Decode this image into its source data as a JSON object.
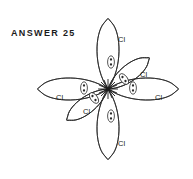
{
  "figure": {
    "caption": "ANSWER 25",
    "title": "ANSWER 25",
    "stroke_color": "#2a2a2a",
    "text_color": "#1b1b1b",
    "background_color": "#ffffff",
    "center_atom": {
      "label": "",
      "x": 108,
      "y": 89
    },
    "ligand_labels": [
      {
        "name": "cl-top",
        "text": "Cl",
        "x": 118,
        "y": 36
      },
      {
        "name": "cl-bottom",
        "text": "Cl",
        "x": 118,
        "y": 140
      },
      {
        "name": "cl-left",
        "text": "Cl",
        "x": 56,
        "y": 94
      },
      {
        "name": "cl-right",
        "text": "Cl",
        "x": 155,
        "y": 94
      },
      {
        "name": "cl-upper-right",
        "text": "Cl",
        "x": 140,
        "y": 71
      },
      {
        "name": "cl-lower-left",
        "text": "Cl",
        "x": 83,
        "y": 108
      }
    ],
    "orbital_lobes": [
      {
        "name": "p-orbital-vertical-top",
        "orientation": "vertical",
        "angle": 90
      },
      {
        "name": "p-orbital-vertical-bottom",
        "orientation": "vertical",
        "angle": 270
      },
      {
        "name": "p-orbital-horizontal-left",
        "orientation": "horizontal",
        "angle": 180
      },
      {
        "name": "p-orbital-horizontal-right",
        "orientation": "horizontal",
        "angle": 0
      },
      {
        "name": "p-orbital-diagonal-upper-right",
        "orientation": "diagonal",
        "angle": 35
      },
      {
        "name": "p-orbital-diagonal-lower-left",
        "orientation": "diagonal",
        "angle": 215
      }
    ],
    "electron_pairs": [
      {
        "name": "electron-pair-top",
        "dots": 2,
        "x": 111,
        "y": 62
      },
      {
        "name": "electron-pair-bottom",
        "dots": 2,
        "x": 111,
        "y": 116
      },
      {
        "name": "electron-pair-left",
        "dots": 2,
        "x": 84,
        "y": 88
      },
      {
        "name": "electron-pair-right",
        "dots": 2,
        "x": 133,
        "y": 88
      },
      {
        "name": "electron-pair-upper-right",
        "dots": 2,
        "x": 124,
        "y": 79
      },
      {
        "name": "electron-pair-lower-left",
        "dots": 2,
        "x": 94,
        "y": 98
      }
    ]
  }
}
